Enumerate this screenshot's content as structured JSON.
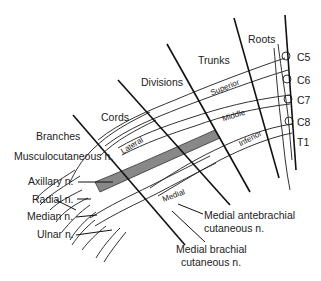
{
  "diagram": {
    "regions": {
      "roots": "Roots",
      "trunks": "Trunks",
      "divisions": "Divisions",
      "cords": "Cords",
      "branches": "Branches"
    },
    "roots": [
      "C5",
      "C6",
      "C7",
      "C8",
      "T1"
    ],
    "trunks": [
      "Superior",
      "Middle",
      "Inferior"
    ],
    "cords": [
      "Lateral",
      "Posterior",
      "Medial"
    ],
    "branches": [
      "Musculocutaneous n.",
      "Axillary n.",
      "Radial n.",
      "Median n.",
      "Ulnar n."
    ],
    "other_nerves": {
      "medial_antebrachial_l1": "Medial antebrachial",
      "medial_antebrachial_l2": "cutaneous n.",
      "medial_brachial_l1": "Medial brachial",
      "medial_brachial_l2": "cutaneous n."
    },
    "colors": {
      "line": "#111111",
      "nerve_fill": "#ffffff",
      "posterior_shade": "#888888",
      "background": "#ffffff"
    }
  }
}
